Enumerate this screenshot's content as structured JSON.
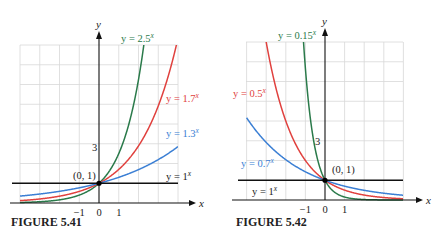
{
  "chart_data": [
    {
      "type": "line",
      "title": "FIGURE 5.41",
      "xlabel": "x",
      "ylabel": "y",
      "xlim": [
        -4,
        4
      ],
      "ylim": [
        0,
        8
      ],
      "grid": true,
      "x_ticks": [
        "-1",
        "0",
        "1"
      ],
      "y_ticks": [
        "3"
      ],
      "point_label": "(0, 1)",
      "series": [
        {
          "name": "y = 2.5^x",
          "base": 2.5,
          "color": "#2a7a4a",
          "label_base": "y = 2.5",
          "label_pos": "top"
        },
        {
          "name": "y = 1.7^x",
          "base": 1.7,
          "color": "#e0413e",
          "label_base": "y = 1.7",
          "label_pos": "right"
        },
        {
          "name": "y = 1.3^x",
          "base": 1.3,
          "color": "#3b7fd4",
          "label_base": "y = 1.3",
          "label_pos": "right"
        },
        {
          "name": "y = 1^x",
          "base": 1.0,
          "color": "#111111",
          "label_base": "y = 1",
          "label_pos": "right"
        }
      ]
    },
    {
      "type": "line",
      "title": "FIGURE 5.42",
      "xlabel": "x",
      "ylabel": "y",
      "xlim": [
        -4,
        4
      ],
      "ylim": [
        0,
        8
      ],
      "grid": true,
      "x_ticks": [
        "-1",
        "0",
        "1"
      ],
      "y_ticks": [
        "3"
      ],
      "point_label": "(0, 1)",
      "series": [
        {
          "name": "y = 0.15^x",
          "base": 0.15,
          "color": "#2a7a4a",
          "label_base": "y = 0.15",
          "label_pos": "top"
        },
        {
          "name": "y = 0.5^x",
          "base": 0.5,
          "color": "#e0413e",
          "label_base": "y = 0.5",
          "label_pos": "left"
        },
        {
          "name": "y = 0.7^x",
          "base": 0.7,
          "color": "#3b7fd4",
          "label_base": "y = 0.7",
          "label_pos": "left"
        },
        {
          "name": "y = 1^x",
          "base": 1.0,
          "color": "#111111",
          "label_base": "y = 1",
          "label_pos": "left"
        }
      ]
    }
  ],
  "exponent_symbol": "x"
}
